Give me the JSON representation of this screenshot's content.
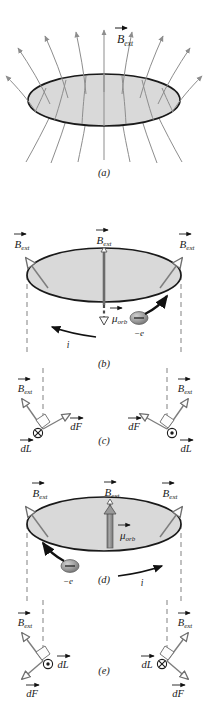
{
  "figure": {
    "kind": "physics-diagram",
    "width": 209,
    "height": 704,
    "colors": {
      "disk_fill": "#d9d9d9",
      "disk_stroke": "#1a1a1a",
      "field_line": "#8d8d8d",
      "vector_gray": "#7d7d7d",
      "dashed": "#8d8d8d",
      "electron_fill": "#9a9a9a",
      "mu_arrow": "#8a8a8a",
      "text": "#1a1a1a",
      "background": "#ffffff"
    }
  },
  "symbols": {
    "B_ext": "B",
    "B_ext_sub": "ext",
    "mu_orb": "μ",
    "mu_orb_sub": "orb",
    "electron": "−e",
    "current": "i",
    "dL": "dL",
    "dF": "dF",
    "into_page": "⊗",
    "out_of_page": "⊙"
  },
  "panels": [
    {
      "id": "a",
      "label": "(a)",
      "caption_y": 172,
      "description": "Diverging external magnetic field lines passing upward through a flat circular disk",
      "vectors": [
        {
          "name": "B_ext",
          "label_x": 117,
          "label_y": 40,
          "direction": "up",
          "style": "field-line-center"
        }
      ],
      "field_line_count": 11,
      "disk": {
        "cx": 104,
        "cy": 100,
        "rx": 76,
        "ry": 26
      }
    },
    {
      "id": "b",
      "label": "(b)",
      "caption_y": 363,
      "description": "Electron circulating so that mu_orb points down, antiparallel to B_ext; current i is counterclockwise",
      "disk": {
        "cx": 104,
        "cy": 275,
        "rx": 77,
        "ry": 27
      },
      "mu_direction": "down",
      "current_direction": "counterclockwise",
      "current_label_x": 68,
      "current_label_y": 343,
      "electron_x": 139,
      "electron_y": 318,
      "electron_label_x": 139,
      "electron_label_y": 333,
      "mu_label_x": 106,
      "mu_label_y": 318,
      "b_labels": [
        {
          "x": 22,
          "y": 243,
          "anchor": "middle"
        },
        {
          "x": 104,
          "y": 238,
          "anchor": "middle"
        },
        {
          "x": 186,
          "y": 243,
          "anchor": "middle"
        }
      ]
    },
    {
      "id": "c",
      "label": "(c)",
      "caption_y": 440,
      "description": "Force elements dF on the current loop for the mu-down case; dF tilts upward on both sides",
      "sides": [
        {
          "side": "left",
          "dL_symbol": "⊗",
          "dL_label_x": 30,
          "dL_label_y": 448,
          "dF_label_x": 72,
          "dF_label_y": 426,
          "B_label_x": 25,
          "B_label_y": 385,
          "dF_direction": "up-right"
        },
        {
          "side": "right",
          "dL_symbol": "⊙",
          "dL_label_x": 185,
          "dL_label_y": 448,
          "dF_label_x": 140,
          "dF_label_y": 426,
          "B_label_x": 183,
          "B_label_y": 385,
          "dF_direction": "up-left"
        }
      ]
    },
    {
      "id": "d",
      "label": "(d)",
      "caption_y": 579,
      "description": "Electron circulating the other way so that mu_orb points up, parallel to B_ext; current i is clockwise",
      "disk": {
        "cx": 104,
        "cy": 524,
        "rx": 77,
        "ry": 27
      },
      "mu_direction": "up",
      "current_direction": "clockwise",
      "current_label_x": 142,
      "current_label_y": 582,
      "electron_x": 70,
      "electron_y": 566,
      "electron_label_x": 68,
      "electron_label_y": 581,
      "mu_label_x": 126,
      "mu_label_y": 535,
      "b_labels": [
        {
          "x": 36,
          "y": 493,
          "anchor": "middle"
        },
        {
          "x": 110,
          "y": 486,
          "anchor": "middle"
        },
        {
          "x": 174,
          "y": 493,
          "anchor": "middle"
        }
      ]
    },
    {
      "id": "e",
      "label": "(e)",
      "caption_y": 670,
      "description": "Force elements dF for the mu-up case; dF tilts downward on both sides",
      "sides": [
        {
          "side": "left",
          "dL_symbol": "⊙",
          "dL_label_x": 45,
          "dL_label_y": 665,
          "dF_label_x": 30,
          "dF_label_y": 690,
          "B_label_x": 25,
          "B_label_y": 629,
          "dF_direction": "down-left"
        },
        {
          "side": "right",
          "dL_symbol": "⊗",
          "dL_label_x": 163,
          "dL_label_y": 665,
          "dF_label_x": 180,
          "dF_label_y": 690,
          "B_label_x": 183,
          "B_label_y": 629,
          "dF_direction": "down-right"
        }
      ]
    }
  ]
}
